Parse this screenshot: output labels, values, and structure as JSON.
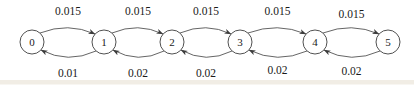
{
  "diagram": {
    "type": "state-transition-markov-chain",
    "nodes": [
      {
        "id": "0",
        "label": "0"
      },
      {
        "id": "1",
        "label": "1"
      },
      {
        "id": "2",
        "label": "2"
      },
      {
        "id": "3",
        "label": "3"
      },
      {
        "id": "4",
        "label": "4"
      },
      {
        "id": "5",
        "label": "5"
      }
    ],
    "edges": [
      {
        "from": "0",
        "to": "1",
        "direction": "forward",
        "label": "0.015"
      },
      {
        "from": "1",
        "to": "2",
        "direction": "forward",
        "label": "0.015"
      },
      {
        "from": "2",
        "to": "3",
        "direction": "forward",
        "label": "0.015"
      },
      {
        "from": "3",
        "to": "4",
        "direction": "forward",
        "label": "0.015"
      },
      {
        "from": "4",
        "to": "5",
        "direction": "forward",
        "label": "0.015"
      },
      {
        "from": "1",
        "to": "0",
        "direction": "backward",
        "label": "0.01"
      },
      {
        "from": "2",
        "to": "1",
        "direction": "backward",
        "label": "0.02"
      },
      {
        "from": "3",
        "to": "2",
        "direction": "backward",
        "label": "0.02"
      },
      {
        "from": "4",
        "to": "3",
        "direction": "backward",
        "label": "0.02"
      },
      {
        "from": "5",
        "to": "4",
        "direction": "backward",
        "label": "0.02"
      }
    ],
    "colors": {
      "background": "#ffffff",
      "stroke": "#3d3d3d",
      "text": "#1a1a1a",
      "node_fill": "#ffffff",
      "scan_band": "#ddd2bd"
    }
  }
}
